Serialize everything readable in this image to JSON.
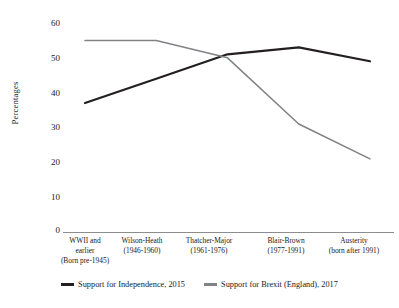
{
  "chart_data": {
    "type": "line",
    "title": "",
    "xlabel": "",
    "ylabel": "Percentages",
    "ylim": [
      0,
      60
    ],
    "yticks": [
      0,
      10,
      20,
      30,
      40,
      50,
      60
    ],
    "grid": false,
    "legend_position": "bottom-center",
    "categories": [
      "WWII and earlier (Born pre-1945)",
      "Wilson-Heath (1946-1960)",
      "Thatcher-Major (1961-1976)",
      "Blair-Brown (1977-1991)",
      "Austerity (born after 1991)"
    ],
    "category_lines": [
      [
        "WWII and",
        "earlier",
        "(Born pre-1945)"
      ],
      [
        "Wilson-Heath",
        "(1946-1960)"
      ],
      [
        "Thatcher-Major",
        "(1961-1976)"
      ],
      [
        "Blair-Brown",
        "(1977-1991)"
      ],
      [
        "Austerity",
        "(born after 1991)"
      ]
    ],
    "series": [
      {
        "name": "Support for Independence, 2015",
        "color": "#231f20",
        "values": [
          37,
          44,
          51,
          53,
          49
        ]
      },
      {
        "name": "Support for Brexit (England), 2017",
        "color": "#808285",
        "values": [
          55,
          55,
          50,
          31,
          21
        ]
      }
    ]
  },
  "axis": {
    "ytick_labels": [
      "60",
      "50",
      "40",
      "30",
      "20",
      "10",
      "0"
    ],
    "ylabel_text": "Percentages"
  },
  "legend": {
    "entries": [
      {
        "label": "Support for Independence, 2015"
      },
      {
        "label": "Support for Brexit (England), 2017"
      }
    ]
  }
}
